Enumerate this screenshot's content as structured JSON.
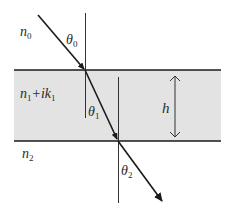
{
  "diagram": {
    "type": "thin-film-refraction",
    "labels": {
      "medium0": {
        "main": "n",
        "sub": "0"
      },
      "medium1": {
        "main": "n",
        "sub1": "1",
        "plus": "+ik",
        "sub2": "1"
      },
      "medium2": {
        "main": "n",
        "sub": "2"
      },
      "theta0": {
        "main": "θ",
        "sub": "0"
      },
      "theta1": {
        "main": "θ",
        "sub": "1"
      },
      "theta2": {
        "main": "θ",
        "sub": "2"
      },
      "thickness": "h"
    },
    "colors": {
      "slab_fill": "#e3e3e3",
      "line": "#1a1a1a",
      "background": "#ffffff"
    }
  }
}
